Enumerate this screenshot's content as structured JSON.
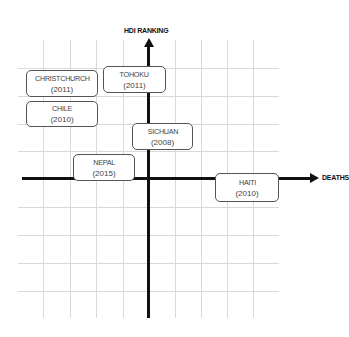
{
  "diagram": {
    "type": "quadrant-scatter",
    "y_axis_label": "HDI RANKING",
    "x_axis_label": "DEATHS",
    "grid": true,
    "colors": {
      "axis": "#111111",
      "grid": "#d9d9d9",
      "box_border": "#555555",
      "text": "#444444"
    },
    "items": [
      {
        "name": "CHRISTCHURCH",
        "year": "(2011)"
      },
      {
        "name": "TOHOKU",
        "year": "(2011)"
      },
      {
        "name": "CHILE",
        "year": "(2010)"
      },
      {
        "name": "SICHUAN",
        "year": "(2008)"
      },
      {
        "name": "NEPAL",
        "year": "(2015)"
      },
      {
        "name": "HAITI",
        "year": "(2010)"
      }
    ]
  }
}
